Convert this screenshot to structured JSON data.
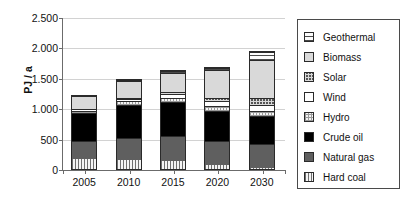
{
  "chart_data": {
    "type": "bar",
    "stacked": true,
    "title": "",
    "subtitle": "",
    "xlabel": "",
    "ylabel": "PJ / a",
    "categories": [
      "2005",
      "2010",
      "2015",
      "2020",
      "2030"
    ],
    "ylim": [
      0,
      2500
    ],
    "ytick_values": [
      0,
      500,
      1000,
      1500,
      2000,
      2500
    ],
    "ytick_labels": [
      "0",
      "500",
      "1.000",
      "1.500",
      "2.000",
      "2.500"
    ],
    "grid": "horizontal",
    "legend_position": "right",
    "series": [
      {
        "name": "Hard coal",
        "pattern": "vertical-stripes",
        "values": [
          160,
          145,
          135,
          60,
          20
        ]
      },
      {
        "name": "Natural gas",
        "pattern": "dark-gray-solid",
        "values": [
          300,
          365,
          410,
          395,
          390
        ]
      },
      {
        "name": "Crude oil",
        "pattern": "black-solid",
        "values": [
          460,
          550,
          560,
          505,
          460
        ]
      },
      {
        "name": "Hydro",
        "pattern": "light-checker",
        "values": [
          40,
          60,
          70,
          80,
          90
        ]
      },
      {
        "name": "Wind",
        "pattern": "white",
        "values": [
          5,
          25,
          60,
          85,
          100
        ]
      },
      {
        "name": "Solar",
        "pattern": "dark-checker",
        "values": [
          0,
          15,
          30,
          50,
          110
        ]
      },
      {
        "name": "Biomass",
        "pattern": "light-gray-solid",
        "values": [
          220,
          280,
          320,
          460,
          630
        ]
      },
      {
        "name": "Geothermal",
        "pattern": "horizontal-stripes",
        "values": [
          0,
          5,
          10,
          25,
          130
        ]
      }
    ],
    "totals": [
      1185,
      1440,
      1595,
      1660,
      1930
    ]
  },
  "legend": {
    "items": [
      {
        "label": "Geothermal",
        "swatch": "geothermal-swatch"
      },
      {
        "label": "Biomass",
        "swatch": "biomass-swatch"
      },
      {
        "label": "Solar",
        "swatch": "solar-swatch"
      },
      {
        "label": "Wind",
        "swatch": "wind-swatch"
      },
      {
        "label": "Hydro",
        "swatch": "hydro-swatch"
      },
      {
        "label": "Crude oil",
        "swatch": "crude-oil-swatch"
      },
      {
        "label": "Natural gas",
        "swatch": "natural-gas-swatch"
      },
      {
        "label": "Hard coal",
        "swatch": "hard-coal-swatch"
      }
    ]
  },
  "colors": {
    "axis": "#6b6b6b",
    "grid": "#d2d2d2",
    "text": "#111111",
    "border": "#2a2a2a",
    "background": "#ffffff"
  }
}
